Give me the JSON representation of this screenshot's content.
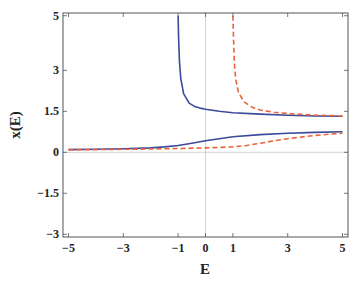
{
  "chart_data": {
    "type": "line",
    "title": "",
    "xlabel": "E",
    "ylabel": "x(E)",
    "xlim": [
      -5.2,
      5.2
    ],
    "ylim": [
      -3.1,
      5.1
    ],
    "xticks": [
      -5,
      -3,
      -1,
      0,
      1,
      3,
      5
    ],
    "yticks": [
      5,
      3,
      1.5,
      0,
      -1.5,
      -3
    ],
    "grid": "zero lines only (x=0 vertical, y=0 horizontal)",
    "legend": null,
    "colors": {
      "blue": "#3b4a9a",
      "orange": "#e8643a"
    },
    "series": [
      {
        "name": "blue-upper-branch",
        "style": "solid",
        "color": "#3b4a9a",
        "x": [
          -1.0,
          -0.98,
          -0.95,
          -0.9,
          -0.8,
          -0.6,
          -0.4,
          -0.2,
          0,
          0.5,
          1,
          2,
          3,
          4,
          5
        ],
        "y": [
          5.0,
          4.2,
          3.3,
          2.7,
          2.15,
          1.8,
          1.68,
          1.62,
          1.58,
          1.5,
          1.45,
          1.4,
          1.36,
          1.33,
          1.32
        ]
      },
      {
        "name": "orange-upper-branch",
        "style": "dashed",
        "color": "#e8643a",
        "x": [
          1.0,
          1.02,
          1.05,
          1.1,
          1.2,
          1.4,
          1.7,
          2,
          2.5,
          3,
          4,
          5
        ],
        "y": [
          5.0,
          4.2,
          3.3,
          2.7,
          2.2,
          1.85,
          1.65,
          1.55,
          1.47,
          1.42,
          1.36,
          1.33
        ]
      },
      {
        "name": "blue-lower-branch",
        "style": "solid",
        "color": "#3b4a9a",
        "x": [
          -5,
          -4,
          -3,
          -2,
          -1.5,
          -1,
          -0.5,
          0,
          0.5,
          1,
          2,
          3,
          4,
          5
        ],
        "y": [
          0.1,
          0.11,
          0.13,
          0.16,
          0.2,
          0.25,
          0.33,
          0.42,
          0.5,
          0.57,
          0.65,
          0.7,
          0.73,
          0.75
        ]
      },
      {
        "name": "orange-lower-branch",
        "style": "dashed",
        "color": "#e8643a",
        "x": [
          -5,
          -4,
          -3,
          -2,
          -1,
          0,
          1,
          1.5,
          2,
          2.5,
          3,
          4,
          5
        ],
        "y": [
          0.1,
          0.1,
          0.11,
          0.12,
          0.14,
          0.16,
          0.2,
          0.25,
          0.33,
          0.42,
          0.5,
          0.62,
          0.7
        ]
      }
    ]
  }
}
